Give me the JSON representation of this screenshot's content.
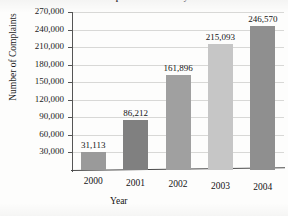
{
  "chart_data": {
    "type": "bar",
    "title": "Complaints Received by the Federal Trade Commission",
    "title_visible_fragment": "Complaints Received by the Federal Trade Commission",
    "xlabel": "Year",
    "ylabel": "Number of Complaints",
    "categories": [
      "2000",
      "2001",
      "2002",
      "2003",
      "2004"
    ],
    "values": [
      31113,
      86212,
      161896,
      215093,
      246570
    ],
    "value_labels": [
      "31,113",
      "86,212",
      "161,896",
      "215,093",
      "246,570"
    ],
    "ylim": [
      0,
      270000
    ],
    "ytick_values": [
      30000,
      60000,
      90000,
      120000,
      150000,
      180000,
      210000,
      240000,
      270000
    ],
    "ytick_labels": [
      "30,000",
      "60,000",
      "90,000",
      "120,000",
      "150,000",
      "180,000",
      "210,000",
      "240,000",
      "270,000"
    ],
    "grid": true,
    "grid_color": "#d8d8d6",
    "legend": null,
    "bar_colors": [
      "#9a9a9a",
      "#808080",
      "#a0a0a0",
      "#c6c6c6",
      "#8f8f8f"
    ],
    "axis_color": "#4a4a4a",
    "background": "#fdfdfc"
  }
}
